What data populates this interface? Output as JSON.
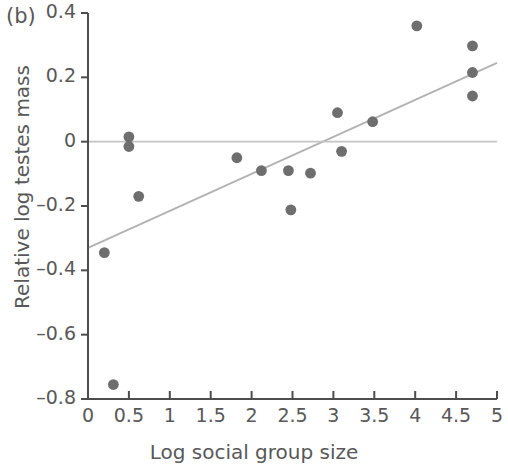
{
  "panel": {
    "label": "(b)"
  },
  "colors": {
    "point": "#6e6e6e",
    "axis": "#4d4d4d",
    "regression_line": "#b2b2b2",
    "zero_line": "#c4c4c4",
    "text": "#585858",
    "background": "#ffffff"
  },
  "chart_data": {
    "type": "scatter",
    "title": "",
    "subtitle": "",
    "panel_label": "(b)",
    "xlabel": "Log social group size",
    "ylabel": "Relative log testes mass",
    "xlim": [
      0,
      5
    ],
    "ylim": [
      -0.8,
      0.4
    ],
    "xticks": [
      0,
      0.5,
      1,
      1.5,
      2,
      2.5,
      3,
      3.5,
      4,
      4.5,
      5
    ],
    "xtick_labels": [
      "0",
      "0.5",
      "1",
      "1.5",
      "2",
      "2.5",
      "3",
      "3.5",
      "4",
      "4.5",
      "5"
    ],
    "yticks": [
      0.4,
      0.2,
      0,
      -0.2,
      -0.4,
      -0.6,
      -0.8
    ],
    "ytick_labels": [
      "0.4",
      "0.2",
      "0",
      "–0.2",
      "–0.4",
      "–0.6",
      "–0.8"
    ],
    "grid": false,
    "legend": null,
    "points": [
      {
        "x": 0.2,
        "y": -0.345
      },
      {
        "x": 0.31,
        "y": -0.755
      },
      {
        "x": 0.5,
        "y": 0.015
      },
      {
        "x": 0.5,
        "y": -0.015
      },
      {
        "x": 0.62,
        "y": -0.17
      },
      {
        "x": 1.82,
        "y": -0.05
      },
      {
        "x": 2.12,
        "y": -0.09
      },
      {
        "x": 2.45,
        "y": -0.09
      },
      {
        "x": 2.48,
        "y": -0.212
      },
      {
        "x": 2.72,
        "y": -0.098
      },
      {
        "x": 3.05,
        "y": 0.09
      },
      {
        "x": 3.1,
        "y": -0.03
      },
      {
        "x": 3.48,
        "y": 0.062
      },
      {
        "x": 4.02,
        "y": 0.36
      },
      {
        "x": 4.7,
        "y": 0.298
      },
      {
        "x": 4.7,
        "y": 0.215
      },
      {
        "x": 4.7,
        "y": 0.142
      }
    ],
    "annotations": [
      {
        "name": "regression-line",
        "type": "line",
        "x1": 0.0,
        "y1": -0.33,
        "x2": 5.0,
        "y2": 0.245
      },
      {
        "name": "zero-reference-line",
        "type": "hline",
        "y": 0.0
      }
    ]
  }
}
